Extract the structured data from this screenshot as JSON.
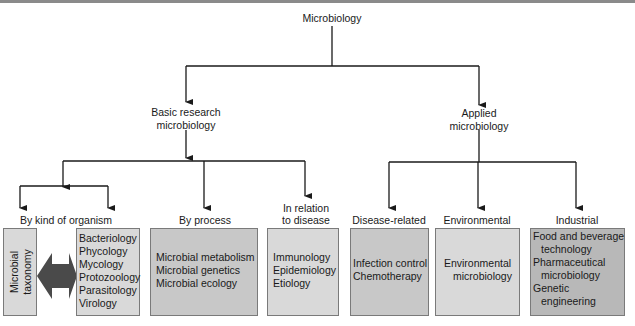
{
  "diagram": {
    "root": "Microbiology",
    "branches": {
      "basic": "Basic research\nmicrobiology",
      "applied": "Applied\nmicrobiology"
    },
    "categories": {
      "by_kind": "By kind of organism",
      "by_process": "By process",
      "in_relation_line1": "In relation",
      "in_relation_line2": "to disease",
      "disease_related": "Disease-related",
      "environmental": "Environmental",
      "industrial": "Industrial"
    },
    "boxes": {
      "taxonomy": {
        "line1": "Microbial",
        "line2": "taxonomy"
      },
      "organisms": [
        "Bacteriology",
        "Phycology",
        "Mycology",
        "Protozoology",
        "Parasitology",
        "Virology"
      ],
      "process": [
        "Microbial metabolism",
        "Microbial genetics",
        "Microbial ecology"
      ],
      "disease": [
        "Immunology",
        "Epidemiology",
        "Etiology"
      ],
      "disease_related": [
        "Infection control",
        "Chemotherapy"
      ],
      "environmental": {
        "line1": "Environmental",
        "line2": "microbiology"
      },
      "industrial": [
        "Food and beverage",
        "technology",
        "Pharmaceutical",
        "microbiology",
        "Genetic",
        "engineering"
      ]
    },
    "colors": {
      "box_light": "#d9d9d9",
      "box_mid": "#c8c8c8",
      "box_dark": "#b8b8b8",
      "double_arrow": "#4a4a4a",
      "lines": "#1a1a1a"
    }
  }
}
